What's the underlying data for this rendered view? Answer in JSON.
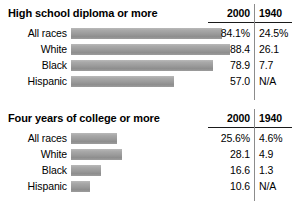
{
  "chart_data": [
    {
      "type": "bar",
      "title": "High school diploma or more",
      "categories": [
        "All races",
        "White",
        "Black",
        "Hispanic"
      ],
      "series": [
        {
          "name": "2000",
          "values": [
            84.1,
            88.4,
            78.9,
            57.0
          ]
        },
        {
          "name": "1940",
          "values": [
            24.5,
            26.1,
            7.7,
            null
          ]
        }
      ],
      "bar_series": "2000",
      "value_labels_2000": [
        "84.1%",
        "88.4",
        "78.9",
        "57.0"
      ],
      "value_labels_1940": [
        "24.5%",
        "26.1",
        "7.7",
        "N/A"
      ],
      "column_headers": [
        "2000",
        "1940"
      ],
      "xlabel": "",
      "ylabel": "",
      "xlim": [
        0,
        100
      ],
      "grid": false,
      "legend": "none",
      "orientation": "horizontal",
      "bar_color": "#9e9e9e"
    },
    {
      "type": "bar",
      "title": "Four years of college or more",
      "categories": [
        "All races",
        "White",
        "Black",
        "Hispanic"
      ],
      "series": [
        {
          "name": "2000",
          "values": [
            25.6,
            28.1,
            16.6,
            10.6
          ]
        },
        {
          "name": "1940",
          "values": [
            4.6,
            4.9,
            1.3,
            null
          ]
        }
      ],
      "bar_series": "2000",
      "value_labels_2000": [
        "25.6%",
        "28.1",
        "16.6",
        "10.6"
      ],
      "value_labels_1940": [
        "4.6%",
        "4.9",
        "1.3",
        "N/A"
      ],
      "column_headers": [
        "2000",
        "1940"
      ],
      "xlabel": "",
      "ylabel": "",
      "xlim": [
        0,
        100
      ],
      "grid": false,
      "legend": "none",
      "orientation": "horizontal",
      "bar_color": "#9e9e9e"
    }
  ],
  "blocks": [
    {
      "title": "High school diploma or more",
      "head_2000": "2000",
      "head_1940": "1940",
      "rows": [
        {
          "label": "All races",
          "bar_pct": 84.1,
          "v2000": "84.1%",
          "v1940": "24.5%"
        },
        {
          "label": "White",
          "bar_pct": 88.4,
          "v2000": "88.4",
          "v1940": "26.1"
        },
        {
          "label": "Black",
          "bar_pct": 78.9,
          "v2000": "78.9",
          "v1940": "7.7"
        },
        {
          "label": "Hispanic",
          "bar_pct": 57.0,
          "v2000": "57.0",
          "v1940": "N/A"
        }
      ]
    },
    {
      "title": "Four years of college or more",
      "head_2000": "2000",
      "head_1940": "1940",
      "rows": [
        {
          "label": "All races",
          "bar_pct": 25.6,
          "v2000": "25.6%",
          "v1940": "4.6%"
        },
        {
          "label": "White",
          "bar_pct": 28.1,
          "v2000": "28.1",
          "v1940": "4.9"
        },
        {
          "label": "Black",
          "bar_pct": 16.6,
          "v2000": "16.6",
          "v1940": "1.3"
        },
        {
          "label": "Hispanic",
          "bar_pct": 10.6,
          "v2000": "10.6",
          "v1940": "N/A"
        }
      ]
    }
  ]
}
